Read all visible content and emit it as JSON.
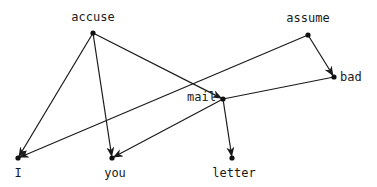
{
  "diagram": {
    "type": "directed-graph",
    "colors": {
      "ink": "#1a1a1a",
      "background": "#ffffff"
    },
    "nodes": [
      {
        "id": "accuse",
        "label": "accuse",
        "x": 93,
        "y": 33,
        "label_x": 93,
        "label_y": 21,
        "anchor": "middle"
      },
      {
        "id": "assume",
        "label": "assume",
        "x": 308,
        "y": 35,
        "label_x": 308,
        "label_y": 22,
        "anchor": "middle"
      },
      {
        "id": "bad",
        "label": "bad",
        "x": 334,
        "y": 77,
        "label_x": 340,
        "label_y": 81,
        "anchor": "start"
      },
      {
        "id": "mail",
        "label": "mail",
        "x": 223,
        "y": 99,
        "label_x": 216,
        "label_y": 101,
        "anchor": "end"
      },
      {
        "id": "I",
        "label": "I",
        "x": 18,
        "y": 158,
        "label_x": 18,
        "label_y": 177,
        "anchor": "middle"
      },
      {
        "id": "you",
        "label": "you",
        "x": 112,
        "y": 158,
        "label_x": 115,
        "label_y": 177,
        "anchor": "middle"
      },
      {
        "id": "letter",
        "label": "letter",
        "x": 232,
        "y": 158,
        "label_x": 234,
        "label_y": 177,
        "anchor": "middle"
      }
    ],
    "edges": [
      {
        "from": "accuse",
        "to": "I",
        "arrow": true
      },
      {
        "from": "accuse",
        "to": "you",
        "arrow": true
      },
      {
        "from": "accuse",
        "to": "mail",
        "arrow": true
      },
      {
        "from": "assume",
        "to": "bad",
        "arrow": true
      },
      {
        "from": "assume",
        "to": "I",
        "arrow": true
      },
      {
        "from": "bad",
        "to": "mail",
        "arrow": false
      },
      {
        "from": "mail",
        "to": "you",
        "arrow": true
      },
      {
        "from": "mail",
        "to": "letter",
        "arrow": true
      }
    ]
  }
}
